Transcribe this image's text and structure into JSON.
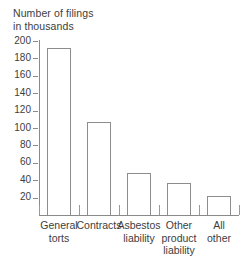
{
  "chart_data": {
    "type": "bar",
    "title": "Number of filings in thousands",
    "title_lines": [
      "Number of filings",
      "in thousands"
    ],
    "xlabel": "",
    "ylabel": "Number of filings in thousands",
    "ylim": [
      0,
      200
    ],
    "ytick_step": 20,
    "grid": false,
    "legend": "none",
    "categories": [
      "General torts",
      "Contracts",
      "Asbestos liability",
      "Other product liability",
      "All other"
    ],
    "category_lines": [
      [
        "General",
        "torts"
      ],
      [
        "Contracts"
      ],
      [
        "Asbestos",
        "liability"
      ],
      [
        "Other",
        "product",
        "liability"
      ],
      [
        "All",
        "other"
      ]
    ],
    "values": [
      192,
      107,
      48,
      37,
      22
    ],
    "ytick_labels": [
      "200",
      "180",
      "160",
      "140",
      "120",
      "100",
      "80",
      "60",
      "40",
      "20"
    ],
    "ytick_values": [
      200,
      180,
      160,
      140,
      120,
      100,
      80,
      60,
      40,
      20
    ],
    "colors": {
      "bar_fill": "#ffffff",
      "bar_outline": "#8d8d8d",
      "axis": "#8a8a8a",
      "text": "#3d3d3d",
      "background": "#ffffff"
    }
  }
}
